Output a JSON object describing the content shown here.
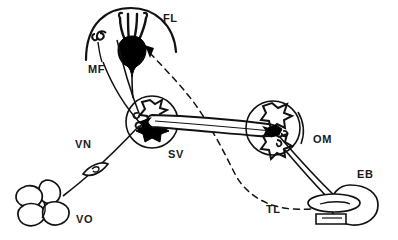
{
  "figure": {
    "kind": "schematic-line-diagram",
    "background_color": "#ffffff",
    "ink_color": "#111111",
    "fill_color": "#000000",
    "width": 398,
    "height": 240,
    "labels": [
      {
        "id": "FL",
        "text": "FL",
        "x": 163,
        "y": 22,
        "target": "fluke-structure"
      },
      {
        "id": "MF",
        "text": "MF",
        "x": 88,
        "y": 73,
        "target": "filament-line"
      },
      {
        "id": "VN",
        "text": "VN",
        "x": 75,
        "y": 148,
        "target": "vein-line"
      },
      {
        "id": "VO",
        "text": "VO",
        "x": 76,
        "y": 223,
        "target": "lobed-organ"
      },
      {
        "id": "SV",
        "text": "SV",
        "x": 168,
        "y": 158,
        "target": "left-node"
      },
      {
        "id": "OM",
        "text": "OM",
        "x": 313,
        "y": 143,
        "target": "right-node"
      },
      {
        "id": "EB",
        "text": "EB",
        "x": 357,
        "y": 178,
        "target": "end-body"
      },
      {
        "id": "TL",
        "text": "TL",
        "x": 266,
        "y": 213,
        "target": "dashed-trajectory"
      }
    ],
    "parts": {
      "fluke": {
        "name": "fluke-structure",
        "tines": 4,
        "cx": 131,
        "cy": 38
      },
      "arc_top": {
        "name": "top-arc",
        "cx": 131,
        "cy": 52,
        "r": 46
      },
      "spiral_mf": {
        "name": "mf-spiral-icon",
        "cx": 98,
        "cy": 38
      },
      "left_node": {
        "name": "left-node",
        "cx": 152,
        "cy": 122,
        "r": 26
      },
      "right_node": {
        "name": "right-node",
        "cx": 273,
        "cy": 128,
        "r": 26
      },
      "end_body": {
        "name": "end-body",
        "cx": 352,
        "cy": 205
      },
      "lobed_organ": {
        "name": "lobed-organ",
        "cx": 42,
        "cy": 203
      },
      "vein_eye": {
        "name": "vein-valve-icon",
        "cx": 95,
        "cy": 168
      },
      "connector": {
        "name": "connector-tube",
        "from": "left-node",
        "to": "right-node"
      },
      "arrow": {
        "name": "direction-arrow",
        "points_to": "fluke-structure"
      },
      "dashed": {
        "name": "dashed-trajectory",
        "style": "dashed"
      }
    }
  }
}
